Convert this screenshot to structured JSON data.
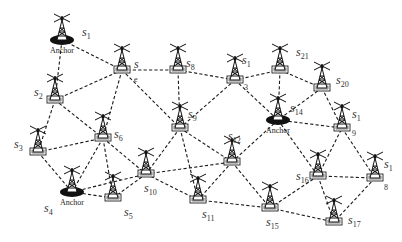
{
  "diagram": {
    "anchor_label": "Anchor",
    "colors": {
      "edge": "#1a1a1a",
      "node": "#222222",
      "background": "#ffffff"
    },
    "nodes": [
      {
        "id": "s1",
        "label": "s",
        "sub": "1",
        "x": 62,
        "y": 40,
        "anchor": true,
        "lx": 82,
        "ly": 36
      },
      {
        "id": "s2",
        "label": "s",
        "sub": "2",
        "x": 55,
        "y": 100,
        "anchor": false,
        "lx": 34,
        "ly": 96
      },
      {
        "id": "s3",
        "label": "s",
        "sub": "3",
        "x": 38,
        "y": 152,
        "anchor": false,
        "lx": 14,
        "ly": 148
      },
      {
        "id": "s4",
        "label": "s",
        "sub": "4",
        "x": 72,
        "y": 192,
        "anchor": true,
        "lx": 44,
        "ly": 212
      },
      {
        "id": "s5",
        "label": "s",
        "sub": "5",
        "x": 113,
        "y": 198,
        "anchor": false,
        "lx": 124,
        "ly": 216
      },
      {
        "id": "s6",
        "label": "s",
        "sub": "6",
        "x": 103,
        "y": 138,
        "anchor": false,
        "lx": 114,
        "ly": 138
      },
      {
        "id": "s7",
        "label": "s",
        "sub": "",
        "x": 122,
        "y": 70,
        "anchor": false,
        "lx": 134,
        "ly": 68
      },
      {
        "id": "s8",
        "label": "s",
        "sub": "8",
        "x": 178,
        "y": 70,
        "anchor": false,
        "lx": 186,
        "ly": 67
      },
      {
        "id": "s9",
        "label": "s",
        "sub": "9",
        "x": 180,
        "y": 128,
        "anchor": false,
        "lx": 188,
        "ly": 118
      },
      {
        "id": "s10",
        "label": "s",
        "sub": "10",
        "x": 146,
        "y": 174,
        "anchor": false,
        "lx": 144,
        "ly": 192
      },
      {
        "id": "s11",
        "label": "s",
        "sub": "11",
        "x": 198,
        "y": 200,
        "anchor": false,
        "lx": 202,
        "ly": 218
      },
      {
        "id": "s12",
        "label": "s",
        "sub": "12",
        "x": 232,
        "y": 162,
        "anchor": false,
        "lx": 228,
        "ly": 140
      },
      {
        "id": "s13",
        "label": "s",
        "sub": "1",
        "x": 235,
        "y": 80,
        "anchor": false,
        "lx": 242,
        "ly": 64
      },
      {
        "id": "s14",
        "label": "s",
        "sub": "14",
        "x": 278,
        "y": 120,
        "anchor": true,
        "lx": 290,
        "ly": 112
      },
      {
        "id": "s15",
        "label": "s",
        "sub": "15",
        "x": 270,
        "y": 208,
        "anchor": false,
        "lx": 266,
        "ly": 226
      },
      {
        "id": "s16",
        "label": "s",
        "sub": "16",
        "x": 318,
        "y": 176,
        "anchor": false,
        "lx": 296,
        "ly": 180
      },
      {
        "id": "s17",
        "label": "s",
        "sub": "17",
        "x": 334,
        "y": 222,
        "anchor": false,
        "lx": 348,
        "ly": 224
      },
      {
        "id": "s18",
        "label": "s",
        "sub": "1",
        "x": 375,
        "y": 178,
        "anchor": false,
        "lx": 384,
        "ly": 168
      },
      {
        "id": "s19",
        "label": "s",
        "sub": "1",
        "x": 342,
        "y": 128,
        "anchor": false,
        "lx": 352,
        "ly": 118
      },
      {
        "id": "s20",
        "label": "s",
        "sub": "20",
        "x": 322,
        "y": 88,
        "anchor": false,
        "lx": 336,
        "ly": 84
      },
      {
        "id": "s21",
        "label": "s",
        "sub": "21",
        "x": 280,
        "y": 70,
        "anchor": false,
        "lx": 296,
        "ly": 56
      }
    ],
    "extra_subscripts": [
      {
        "text": "3",
        "x": 244,
        "y": 90
      },
      {
        "text": "9",
        "x": 352,
        "y": 136
      },
      {
        "text": "8",
        "x": 384,
        "y": 190
      },
      {
        "text": "e",
        "x": 134,
        "y": 82
      }
    ],
    "edges": [
      [
        "s1",
        "s2"
      ],
      [
        "s1",
        "s7"
      ],
      [
        "s2",
        "s7"
      ],
      [
        "s2",
        "s3"
      ],
      [
        "s2",
        "s6"
      ],
      [
        "s3",
        "s6"
      ],
      [
        "s3",
        "s4"
      ],
      [
        "s7",
        "s8"
      ],
      [
        "s7",
        "s6"
      ],
      [
        "s7",
        "s9"
      ],
      [
        "s8",
        "s13"
      ],
      [
        "s8",
        "s9"
      ],
      [
        "s13",
        "s21"
      ],
      [
        "s13",
        "s9"
      ],
      [
        "s13",
        "s14"
      ],
      [
        "s21",
        "s20"
      ],
      [
        "s21",
        "s14"
      ],
      [
        "s20",
        "s14"
      ],
      [
        "s20",
        "s19"
      ],
      [
        "s14",
        "s19"
      ],
      [
        "s14",
        "s16"
      ],
      [
        "s14",
        "s12"
      ],
      [
        "s9",
        "s10"
      ],
      [
        "s9",
        "s12"
      ],
      [
        "s9",
        "s11"
      ],
      [
        "s6",
        "s10"
      ],
      [
        "s6",
        "s5"
      ],
      [
        "s6",
        "s4"
      ],
      [
        "s4",
        "s5"
      ],
      [
        "s4",
        "s10"
      ],
      [
        "s5",
        "s10"
      ],
      [
        "s10",
        "s12"
      ],
      [
        "s10",
        "s11"
      ],
      [
        "s12",
        "s11"
      ],
      [
        "s12",
        "s15"
      ],
      [
        "s11",
        "s15"
      ],
      [
        "s15",
        "s16"
      ],
      [
        "s15",
        "s17"
      ],
      [
        "s16",
        "s19"
      ],
      [
        "s16",
        "s18"
      ],
      [
        "s16",
        "s17"
      ],
      [
        "s19",
        "s18"
      ],
      [
        "s18",
        "s17"
      ]
    ]
  }
}
